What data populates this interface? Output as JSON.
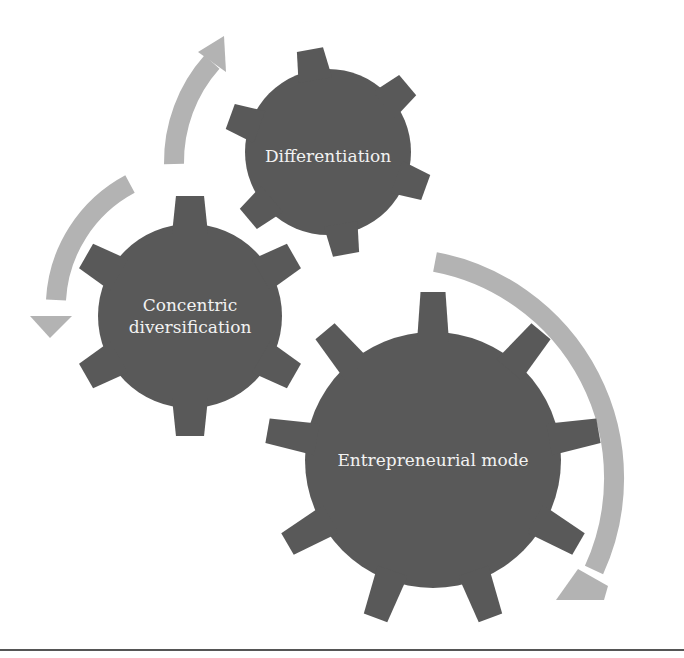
{
  "diagram": {
    "type": "gear-cycle",
    "colors": {
      "gear": "#595959",
      "arrow": "#b3b3b3",
      "label": "#f2f2f2",
      "rule": "#555555"
    },
    "gears": [
      {
        "id": "differentiation",
        "label": "Differentiation",
        "cx": 328,
        "cy": 152,
        "r_body": 83,
        "r_tip": 104,
        "teeth": 6,
        "rotation": -10,
        "tooth_width": 34
      },
      {
        "id": "concentric",
        "label": "Concentric\ndiversification",
        "cx": 190,
        "cy": 316,
        "r_body": 92,
        "r_tip": 120,
        "teeth": 6,
        "rotation": 0,
        "tooth_width": 36
      },
      {
        "id": "entrepreneurial",
        "label": "Entrepreneurial mode",
        "cx": 433,
        "cy": 460,
        "r_body": 128,
        "r_tip": 168,
        "teeth": 9,
        "rotation": 0,
        "tooth_width": 32
      }
    ],
    "arrows": [
      {
        "id": "arrow-concentric-to-differentiation",
        "from": "concentric",
        "to": "differentiation"
      },
      {
        "id": "arrow-differentiation-to-concentric",
        "from": "differentiation",
        "to": "concentric"
      },
      {
        "id": "arrow-entrepreneurial-cycle",
        "from": "differentiation",
        "to": "entrepreneurial"
      }
    ]
  }
}
